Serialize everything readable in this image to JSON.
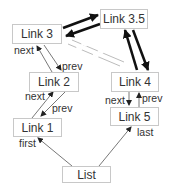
{
  "diagram": {
    "nodes": [
      {
        "id": "link3_5",
        "label": "Link 3.5"
      },
      {
        "id": "link3",
        "label": "Link 3"
      },
      {
        "id": "link2",
        "label": "Link 2"
      },
      {
        "id": "link4",
        "label": "Link 4"
      },
      {
        "id": "link1",
        "label": "Link 1"
      },
      {
        "id": "link5",
        "label": "Link 5"
      },
      {
        "id": "list",
        "label": "List"
      }
    ],
    "edge_labels": {
      "link3_next": "next",
      "link2_prev": "prev",
      "link2_next": "next",
      "link1_prev": "prev",
      "first": "first",
      "link4_next": "next",
      "link4_prev": "prev",
      "last": "last"
    },
    "edges": [
      {
        "from": "Link 3",
        "to": "Link 3.5",
        "style": "bold"
      },
      {
        "from": "Link 3.5",
        "to": "Link 3",
        "style": "bold"
      },
      {
        "from": "Link 3.5",
        "to": "Link 4",
        "style": "bold"
      },
      {
        "from": "Link 4",
        "to": "Link 3.5",
        "style": "bold"
      },
      {
        "from": "Link 3",
        "to": "Link 4",
        "style": "removed-dashed"
      },
      {
        "from": "Link 2",
        "to": "Link 3",
        "label": "next"
      },
      {
        "from": "Link 3",
        "to": "Link 2",
        "label": "prev"
      },
      {
        "from": "Link 1",
        "to": "Link 2",
        "label": "next"
      },
      {
        "from": "Link 2",
        "to": "Link 1",
        "label": "prev"
      },
      {
        "from": "List",
        "to": "Link 1",
        "label": "first"
      },
      {
        "from": "Link 4",
        "to": "Link 5",
        "label": "next"
      },
      {
        "from": "Link 5",
        "to": "Link 4",
        "label": "prev"
      },
      {
        "from": "List",
        "to": "Link 5",
        "label": "last"
      }
    ]
  }
}
